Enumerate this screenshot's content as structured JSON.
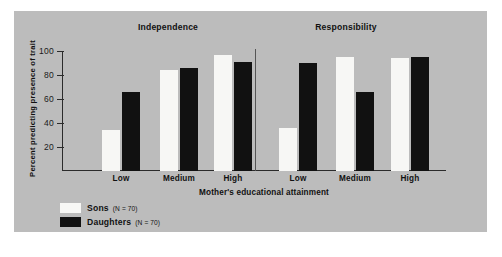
{
  "figure": {
    "background": "#ffffff",
    "panel_background": "#bcbcbc"
  },
  "chart_data": {
    "type": "bar",
    "title": "",
    "panels": [
      {
        "title": "Independence"
      },
      {
        "title": "Responsibility"
      }
    ],
    "categories": [
      "Low",
      "Medium",
      "High"
    ],
    "xlabel": "Mother's educational attainment",
    "ylabel": "Percent predicting presence of trait",
    "ylim": [
      0,
      100
    ],
    "yticks": [
      20,
      40,
      60,
      80,
      100
    ],
    "grid": false,
    "legend_position": "bottom-left",
    "series": [
      {
        "name": "Sons",
        "n_label": "(N = 70)",
        "color": "#f7f7f5",
        "panel_values": {
          "Independence": [
            34,
            84,
            97
          ],
          "Responsibility": [
            36,
            95,
            94
          ]
        }
      },
      {
        "name": "Daughters",
        "n_label": "(N = 70)",
        "color": "#111111",
        "panel_values": {
          "Independence": [
            66,
            86,
            91
          ],
          "Responsibility": [
            90,
            66,
            95
          ]
        }
      }
    ]
  }
}
